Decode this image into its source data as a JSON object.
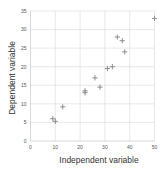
{
  "chart_data": {
    "type": "scatter",
    "title": "",
    "xlabel": "Independent variable",
    "ylabel": "Dependent variable",
    "xlim": [
      0,
      50
    ],
    "ylim": [
      0,
      35
    ],
    "x_ticks": [
      0,
      10,
      20,
      30,
      40,
      50
    ],
    "y_ticks": [
      0,
      5,
      10,
      15,
      20,
      25,
      30,
      35
    ],
    "grid": true,
    "legend": null,
    "marker": "plus",
    "marker_color": "#8c8c8c",
    "series": [
      {
        "name": "data",
        "points": [
          {
            "x": 9,
            "y": 6
          },
          {
            "x": 10,
            "y": 5.3
          },
          {
            "x": 13,
            "y": 9.2
          },
          {
            "x": 22,
            "y": 13
          },
          {
            "x": 22,
            "y": 13.5
          },
          {
            "x": 26,
            "y": 17
          },
          {
            "x": 28,
            "y": 14.5
          },
          {
            "x": 31,
            "y": 19.5
          },
          {
            "x": 33,
            "y": 20
          },
          {
            "x": 35,
            "y": 28
          },
          {
            "x": 37,
            "y": 27
          },
          {
            "x": 38,
            "y": 24
          },
          {
            "x": 50,
            "y": 33
          }
        ]
      }
    ]
  }
}
